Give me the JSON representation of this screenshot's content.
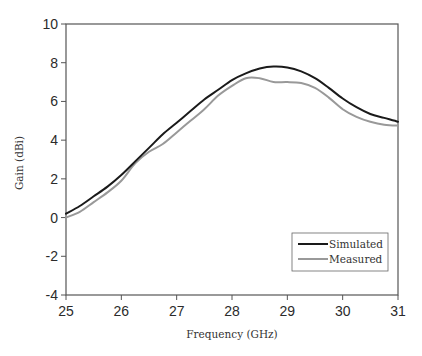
{
  "chart_data": {
    "type": "line",
    "title": "",
    "xlabel": "Frequency (GHz)",
    "ylabel": "Gain (dBi)",
    "xlim": [
      25,
      31
    ],
    "ylim": [
      -4,
      10
    ],
    "xticks": [
      25,
      26,
      27,
      28,
      29,
      30,
      31
    ],
    "yticks": [
      -4,
      -2,
      0,
      2,
      4,
      6,
      8,
      10
    ],
    "grid": false,
    "legend_position": "lower right",
    "x": [
      25,
      25.25,
      25.5,
      25.75,
      26,
      26.25,
      26.5,
      26.75,
      27,
      27.25,
      27.5,
      27.75,
      28,
      28.25,
      28.5,
      28.75,
      29,
      29.25,
      29.5,
      29.75,
      30,
      30.25,
      30.5,
      30.75,
      31
    ],
    "series": [
      {
        "name": "Simulated",
        "color": "#1a1a1a",
        "values": [
          0.2,
          0.6,
          1.1,
          1.6,
          2.2,
          2.9,
          3.6,
          4.3,
          4.9,
          5.5,
          6.1,
          6.6,
          7.1,
          7.45,
          7.7,
          7.8,
          7.75,
          7.55,
          7.2,
          6.7,
          6.15,
          5.7,
          5.35,
          5.15,
          4.95
        ]
      },
      {
        "name": "Measured",
        "color": "#999999",
        "values": [
          0.0,
          0.3,
          0.8,
          1.3,
          1.9,
          2.8,
          3.4,
          3.8,
          4.4,
          5.0,
          5.6,
          6.3,
          6.8,
          7.2,
          7.2,
          7.0,
          7.0,
          6.95,
          6.7,
          6.2,
          5.6,
          5.2,
          4.95,
          4.8,
          4.75
        ]
      }
    ]
  },
  "legend": {
    "items": [
      {
        "label": "Simulated",
        "color": "#1a1a1a"
      },
      {
        "label": "Measured",
        "color": "#999999"
      }
    ]
  }
}
